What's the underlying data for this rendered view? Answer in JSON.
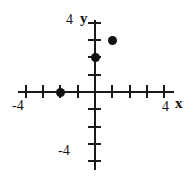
{
  "chart_data": {
    "type": "scatter",
    "title": "",
    "xlabel": "x",
    "ylabel": "y",
    "xlim": [
      -4.5,
      4.5
    ],
    "ylim": [
      -4.5,
      4.5
    ],
    "grid": false,
    "legend": null,
    "x_ticks": [
      -4,
      -3,
      -2,
      -1,
      1,
      2,
      3,
      4
    ],
    "y_ticks": [
      -4,
      -3,
      -2,
      -1,
      1,
      2,
      3,
      4
    ],
    "x_tick_labels_shown": [
      "-4",
      "4"
    ],
    "y_tick_labels_shown": [
      "4",
      "-4"
    ],
    "points": [
      {
        "x": 1,
        "y": 3
      },
      {
        "x": 0,
        "y": 2
      },
      {
        "x": -2,
        "y": 0
      }
    ],
    "point_color": "#111111",
    "axis_color": "#1a1a1a",
    "background": "#ffffff"
  },
  "labels": {
    "x_axis_name": "x",
    "y_axis_name": "y",
    "x_min_label": "-4",
    "x_max_label": "4",
    "y_max_label": "4",
    "y_min_label": "-4"
  }
}
